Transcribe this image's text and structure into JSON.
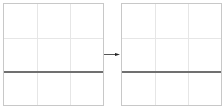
{
  "diagram": {
    "panels": [
      {
        "id": "left",
        "grid": "3x3",
        "marker_line": "horizontal"
      },
      {
        "id": "right",
        "grid": "3x3",
        "marker_line": "horizontal"
      }
    ],
    "connector": {
      "type": "arrow",
      "direction": "right"
    },
    "colors": {
      "border": "#c8c8c8",
      "grid": "#e6e6e6",
      "line": "#707070",
      "arrow": "#333333"
    }
  }
}
